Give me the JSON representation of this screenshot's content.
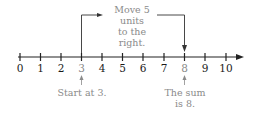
{
  "number_line": {
    "min": 0,
    "max": 10,
    "ticks": [
      "0",
      "1",
      "2",
      "3",
      "4",
      "5",
      "6",
      "7",
      "8",
      "9",
      "10"
    ],
    "highlighted": [
      "3",
      "8"
    ],
    "line_color": "#222222",
    "annotation_color": "#8a8a8a"
  },
  "annotations": {
    "move": {
      "line1": "Move 5 units",
      "line2": "to the right."
    },
    "start": {
      "text": "Start at 3."
    },
    "sum": {
      "line1": "The sum",
      "line2": "is 8."
    }
  }
}
